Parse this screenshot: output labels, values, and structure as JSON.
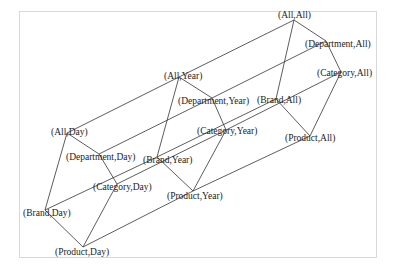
{
  "diagram": {
    "type": "lattice",
    "nodes": [
      {
        "id": "AA",
        "label": "(All,All)",
        "x": 294,
        "y": 20,
        "lx": 278,
        "ly": 18
      },
      {
        "id": "DA",
        "label": "(Department,All)",
        "x": 326,
        "y": 41,
        "lx": 305,
        "ly": 47
      },
      {
        "id": "CA",
        "label": "(Category,All)",
        "x": 341,
        "y": 72,
        "lx": 317,
        "ly": 76
      },
      {
        "id": "BA",
        "label": "(Brand,All)",
        "x": 276,
        "y": 99,
        "lx": 257,
        "ly": 103
      },
      {
        "id": "PA",
        "label": "(Product,All)",
        "x": 310,
        "y": 136,
        "lx": 285,
        "ly": 141
      },
      {
        "id": "AY",
        "label": "(All,Year)",
        "x": 179,
        "y": 77,
        "lx": 164,
        "ly": 79
      },
      {
        "id": "DY",
        "label": "(Department,Year)",
        "x": 212,
        "y": 98,
        "lx": 178,
        "ly": 104
      },
      {
        "id": "CY",
        "label": "(Category,Year)",
        "x": 226,
        "y": 130,
        "lx": 197,
        "ly": 134
      },
      {
        "id": "BY",
        "label": "(Brand,Year)",
        "x": 157,
        "y": 157,
        "lx": 143,
        "ly": 163
      },
      {
        "id": "PY",
        "label": "(Product,Year)",
        "x": 193,
        "y": 191,
        "lx": 167,
        "ly": 199
      },
      {
        "id": "AD",
        "label": "(All,Day)",
        "x": 67,
        "y": 133,
        "lx": 51,
        "ly": 135
      },
      {
        "id": "DD",
        "label": "(Department,Day)",
        "x": 99,
        "y": 154,
        "lx": 66,
        "ly": 160
      },
      {
        "id": "CD",
        "label": "(Category,Day)",
        "x": 117,
        "y": 184,
        "lx": 93,
        "ly": 190
      },
      {
        "id": "BD",
        "label": "(Brand,Day)",
        "x": 45,
        "y": 210,
        "lx": 23,
        "ly": 216
      },
      {
        "id": "PD",
        "label": "(Product,Day)",
        "x": 83,
        "y": 247,
        "lx": 55,
        "ly": 255
      }
    ],
    "edges": [
      [
        "AA",
        "DA"
      ],
      [
        "DA",
        "CA"
      ],
      [
        "AA",
        "BA"
      ],
      [
        "CA",
        "PA"
      ],
      [
        "BA",
        "PA"
      ],
      [
        "AY",
        "DY"
      ],
      [
        "DY",
        "CY"
      ],
      [
        "AY",
        "BY"
      ],
      [
        "CY",
        "PY"
      ],
      [
        "BY",
        "PY"
      ],
      [
        "AD",
        "DD"
      ],
      [
        "DD",
        "CD"
      ],
      [
        "AD",
        "BD"
      ],
      [
        "CD",
        "PD"
      ],
      [
        "BD",
        "PD"
      ],
      [
        "AA",
        "AY"
      ],
      [
        "AY",
        "AD"
      ],
      [
        "DA",
        "DY"
      ],
      [
        "DY",
        "DD"
      ],
      [
        "CA",
        "CY"
      ],
      [
        "CY",
        "CD"
      ],
      [
        "BA",
        "BY"
      ],
      [
        "BY",
        "BD"
      ],
      [
        "PA",
        "PY"
      ],
      [
        "PY",
        "PD"
      ]
    ]
  }
}
